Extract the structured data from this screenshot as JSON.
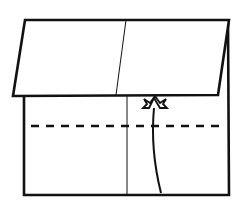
{
  "diagram": {
    "type": "origami-fold-step",
    "description": "Paper square with top flap folded down; valley fold dashed line; arrow indicating fold upward",
    "colors": {
      "stroke": "#111111",
      "background": "#ffffff",
      "paper": "#ffffff"
    },
    "elements": {
      "folded_flap": "folded-flap",
      "base_square": "base-paper",
      "center_crease": "center-crease",
      "valley_fold_line": "valley-fold-line",
      "fold_arrow": "fold-up-arrow"
    }
  }
}
